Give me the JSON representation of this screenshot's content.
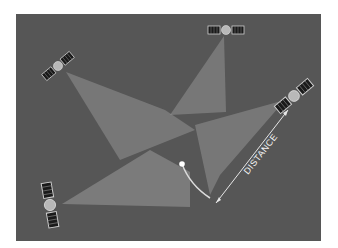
{
  "diagram": {
    "background_color": "#565656",
    "beam_color": "#9a9a9a",
    "arrow_color": "#e6e6e6",
    "receiver": {
      "x": 182,
      "y": 164,
      "color": "#ffffff"
    },
    "distance_label": "DISTANCE",
    "satellites": [
      {
        "name": "satellite-top-left",
        "x": 58,
        "y": 66,
        "rotation": 40
      },
      {
        "name": "satellite-top-right",
        "x": 226,
        "y": 30,
        "rotation": 0
      },
      {
        "name": "satellite-right",
        "x": 294,
        "y": 96,
        "rotation": 40
      },
      {
        "name": "satellite-bottom-left",
        "x": 50,
        "y": 205,
        "rotation": 10
      }
    ]
  }
}
